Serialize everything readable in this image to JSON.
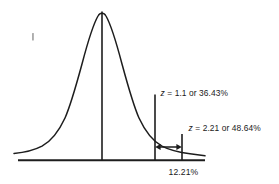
{
  "figure": {
    "background_color": "#ffffff",
    "ink_color": "#1d1d1d"
  },
  "annotations": {
    "z1_label": "z = 1.1 or 36.43%",
    "z2_label": "z = 2.21 or 48.64%",
    "region_label": "12.21%"
  },
  "chart_data": {
    "type": "area",
    "xlabel": "",
    "ylabel": "",
    "grid": false,
    "legend": null,
    "curve": "standard normal bell curve",
    "mean_line_z": 0,
    "markers": [
      {
        "name": "z-1.1",
        "z": 1.1,
        "area_percent": 36.43,
        "label": "z = 1.1 or 36.43%"
      },
      {
        "name": "z-2.21",
        "z": 2.21,
        "area_percent": 48.64,
        "label": "z = 2.21 or 48.64%"
      }
    ],
    "shaded_region": {
      "from_z": 1.1,
      "to_z": 2.21,
      "area_percent": 12.21,
      "label": "12.21%"
    }
  }
}
